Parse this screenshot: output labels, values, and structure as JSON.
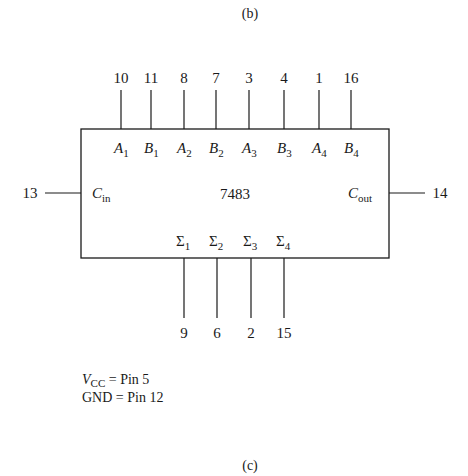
{
  "captions": {
    "top": "(b)",
    "bottom": "(c)"
  },
  "chip": {
    "name": "7483",
    "top_pins": [
      {
        "pin": "10",
        "label": "A",
        "sub": "1",
        "x": 121
      },
      {
        "pin": "11",
        "label": "B",
        "sub": "1",
        "x": 151
      },
      {
        "pin": "8",
        "label": "A",
        "sub": "2",
        "x": 184
      },
      {
        "pin": "7",
        "label": "B",
        "sub": "2",
        "x": 216
      },
      {
        "pin": "3",
        "label": "A",
        "sub": "3",
        "x": 249
      },
      {
        "pin": "4",
        "label": "B",
        "sub": "3",
        "x": 284
      },
      {
        "pin": "1",
        "label": "A",
        "sub": "4",
        "x": 319
      },
      {
        "pin": "16",
        "label": "B",
        "sub": "4",
        "x": 351
      }
    ],
    "bottom_pins": [
      {
        "pin": "9",
        "label": "Σ",
        "sub": "1",
        "x": 184
      },
      {
        "pin": "6",
        "label": "Σ",
        "sub": "2",
        "x": 217
      },
      {
        "pin": "2",
        "label": "Σ",
        "sub": "3",
        "x": 251
      },
      {
        "pin": "15",
        "label": "Σ",
        "sub": "4",
        "x": 284
      }
    ],
    "left_pin": {
      "pin": "13",
      "label": "C",
      "sub": "in"
    },
    "right_pin": {
      "pin": "14",
      "label": "C",
      "sub": "out"
    }
  },
  "notes": {
    "vcc_label": "V",
    "vcc_sub": "CC",
    "vcc_value": " = Pin 5",
    "gnd": "GND = Pin 12"
  }
}
